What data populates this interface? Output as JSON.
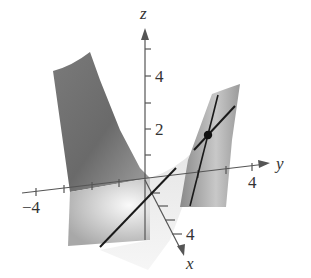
{
  "figure": {
    "type": "3d-surface-plot",
    "axes": {
      "x": {
        "label": "x",
        "tick_label": "4"
      },
      "y": {
        "label": "y",
        "tick_labels": [
          "-4",
          "4"
        ],
        "neg_label": "−4",
        "pos_label": "4"
      },
      "z": {
        "label": "z",
        "tick_labels": [
          "2",
          "4"
        ],
        "label_2": "2",
        "label_4": "4"
      }
    },
    "marked_point": {
      "shape": "filled-circle",
      "color": "#111111"
    },
    "colors": {
      "axis": "#555555",
      "surface_dark": "#6e6e6e",
      "surface_light": "#e8e8e8",
      "tangent_line": "#1a1a1a"
    }
  }
}
